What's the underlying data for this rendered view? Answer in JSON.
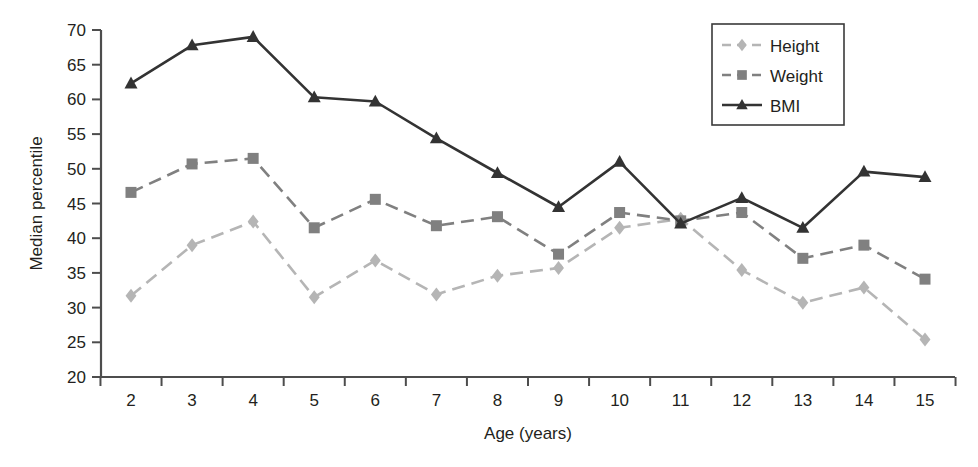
{
  "chart_data": {
    "type": "line",
    "title": "",
    "subtitle": "",
    "xlabel": "Age (years)",
    "ylabel": "Median percentile",
    "x": [
      2,
      3,
      4,
      5,
      6,
      7,
      8,
      9,
      10,
      11,
      12,
      13,
      14,
      15
    ],
    "categories": [
      "2",
      "3",
      "4",
      "5",
      "6",
      "7",
      "8",
      "9",
      "10",
      "11",
      "12",
      "13",
      "14",
      "15"
    ],
    "xtick_labels": [
      "2",
      "3",
      "4",
      "5",
      "6",
      "7",
      "8",
      "9",
      "10",
      "11",
      "12",
      "13",
      "14",
      "15"
    ],
    "ytick_labels": [
      "20",
      "25",
      "30",
      "35",
      "40",
      "45",
      "50",
      "55",
      "60",
      "65",
      "70"
    ],
    "ytick_values": [
      20,
      25,
      30,
      35,
      40,
      45,
      50,
      55,
      60,
      65,
      70
    ],
    "ylim": [
      20,
      70
    ],
    "xlim": [
      2,
      15
    ],
    "grid": false,
    "legend_position": "top-right",
    "series": [
      {
        "name": "Height",
        "marker": "diamond",
        "linestyle": "dashed",
        "color": "#b5b5b5",
        "values": [
          31.7,
          39.0,
          42.4,
          31.5,
          36.8,
          31.9,
          34.6,
          35.7,
          41.5,
          42.8,
          35.4,
          30.7,
          32.9,
          25.4
        ]
      },
      {
        "name": "Weight",
        "marker": "square",
        "linestyle": "dashed",
        "color": "#808080",
        "values": [
          46.6,
          50.7,
          51.5,
          41.5,
          45.6,
          41.8,
          43.1,
          37.7,
          43.7,
          42.5,
          43.7,
          37.1,
          39.0,
          34.1
        ]
      },
      {
        "name": "BMI",
        "marker": "triangle",
        "linestyle": "solid",
        "color": "#333333",
        "values": [
          62.3,
          67.8,
          69.0,
          60.3,
          59.7,
          54.4,
          49.4,
          44.5,
          51.0,
          42.1,
          45.8,
          41.5,
          49.6,
          48.8
        ]
      }
    ]
  },
  "legend": {
    "items": [
      {
        "label": "Height"
      },
      {
        "label": "Weight"
      },
      {
        "label": "BMI"
      }
    ]
  },
  "axes": {
    "y_title": "Median percentile",
    "x_title": "Age (years)"
  }
}
